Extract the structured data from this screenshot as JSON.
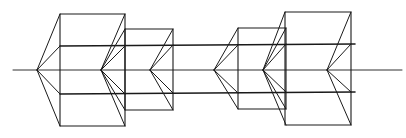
{
  "diagram": {
    "size": {
      "width": 406,
      "height": 138
    },
    "colors": {
      "background": "#ffffff",
      "ink": "#1a1a1a"
    },
    "axis": {
      "x1": 13,
      "y1": 70,
      "x2": 402,
      "y2": 70
    },
    "bands": [
      {
        "name": "upper",
        "x1": 60,
        "y1": 46,
        "x2": 355,
        "y2": 44
      },
      {
        "name": "lower",
        "x1": 60,
        "y1": 94,
        "x2": 355,
        "y2": 92
      }
    ],
    "boxes": [
      {
        "name": "box-1-large-left",
        "x": 60,
        "y": 14,
        "w": 65,
        "h": 112
      },
      {
        "name": "box-2-medium-left",
        "x": 125,
        "y": 29,
        "w": 48,
        "h": 81
      },
      {
        "name": "box-3-medium-right",
        "x": 238,
        "y": 28,
        "w": 48,
        "h": 81
      },
      {
        "name": "box-4-large-right",
        "x": 285,
        "y": 12,
        "w": 66,
        "h": 113
      }
    ],
    "apexes": [
      {
        "name": "apex-1",
        "x": 37,
        "y": 70,
        "targets": [
          [
            60,
            14
          ],
          [
            60,
            46
          ],
          [
            60,
            94
          ],
          [
            60,
            126
          ]
        ]
      },
      {
        "name": "apex-2",
        "x": 101,
        "y": 70,
        "targets": [
          [
            125,
            14
          ],
          [
            125,
            29
          ],
          [
            125,
            46
          ],
          [
            125,
            94
          ],
          [
            125,
            110
          ],
          [
            125,
            126
          ]
        ]
      },
      {
        "name": "apex-3",
        "x": 150,
        "y": 70,
        "targets": [
          [
            173,
            29
          ],
          [
            173,
            45
          ],
          [
            173,
            93
          ],
          [
            173,
            110
          ]
        ]
      },
      {
        "name": "apex-4",
        "x": 214,
        "y": 70,
        "targets": [
          [
            238,
            28
          ],
          [
            238,
            45
          ],
          [
            238,
            93
          ],
          [
            238,
            109
          ]
        ]
      },
      {
        "name": "apex-5",
        "x": 263,
        "y": 70,
        "targets": [
          [
            285,
            12
          ],
          [
            286,
            28
          ],
          [
            286,
            44
          ],
          [
            286,
            92
          ],
          [
            286,
            109
          ],
          [
            286,
            125
          ]
        ]
      },
      {
        "name": "apex-6",
        "x": 327,
        "y": 70,
        "targets": [
          [
            351,
            12
          ],
          [
            351,
            44
          ],
          [
            351,
            92
          ],
          [
            351,
            125
          ]
        ]
      }
    ]
  }
}
